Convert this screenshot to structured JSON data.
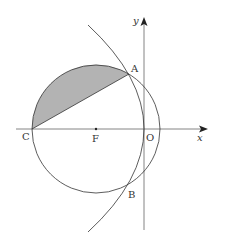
{
  "diagram": {
    "type": "geometry",
    "labels": {
      "A": "A",
      "B": "B",
      "C": "C",
      "F": "F",
      "O": "O",
      "x_axis": "x",
      "y_axis": "y"
    },
    "colors": {
      "stroke": "#333333",
      "shade": "#b0b0b0",
      "axis": "#555555"
    },
    "elements": [
      {
        "kind": "axis",
        "name": "x"
      },
      {
        "kind": "axis",
        "name": "y"
      },
      {
        "kind": "circle",
        "center": "F",
        "through": [
          "C",
          "A",
          "B"
        ]
      },
      {
        "kind": "parabola",
        "vertex": "O",
        "through": [
          "A",
          "B"
        ]
      },
      {
        "kind": "segment",
        "from": "C",
        "to": "A"
      },
      {
        "kind": "shaded-region",
        "bounded_by": [
          "arc CA",
          "segment CA"
        ]
      }
    ]
  }
}
